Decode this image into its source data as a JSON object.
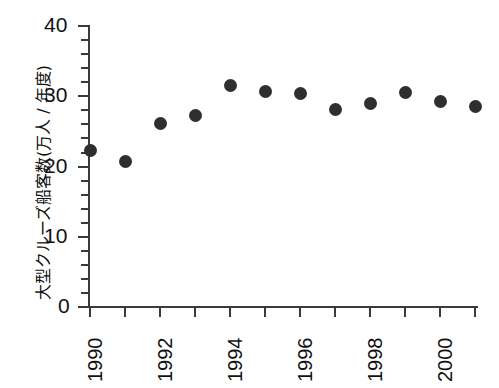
{
  "chart_data": {
    "type": "scatter",
    "title": "",
    "xlabel": "",
    "ylabel": "大型クルーズ船客数(万人 / 年度)",
    "x": [
      1990,
      1991,
      1992,
      1993,
      1994,
      1995,
      1996,
      1997,
      1998,
      1999,
      2000,
      2001
    ],
    "values": [
      22.2,
      20.6,
      26.0,
      27.2,
      31.4,
      30.6,
      30.3,
      28.0,
      28.8,
      30.4,
      29.2,
      28.4
    ],
    "xlim": [
      1989.5,
      2001.5
    ],
    "ylim": [
      0,
      40
    ],
    "y_ticks": [
      0,
      10,
      20,
      30,
      40
    ],
    "y_tick_labels": [
      "0",
      "10",
      "20",
      "30",
      "40"
    ],
    "y_minor_step": 2,
    "x_ticks": [
      1990,
      1991,
      1992,
      1993,
      1994,
      1995,
      1996,
      1997,
      1998,
      1999,
      2000,
      2001
    ],
    "x_tick_labels": [
      "1990",
      "",
      "1992",
      "",
      "1994",
      "",
      "1996",
      "",
      "1998",
      "",
      "2000",
      ""
    ],
    "grid": false,
    "legend": null,
    "marker_color": "#2f2f2f",
    "axis_color": "#3a3a3a"
  },
  "axis": {
    "y_label": "大型クルーズ船客数(万人 / 年度)",
    "y_tick_0": "0",
    "y_tick_10": "10",
    "y_tick_20": "20",
    "y_tick_30": "30",
    "y_tick_40": "40",
    "x_tick_1990": "1990",
    "x_tick_1992": "1992",
    "x_tick_1994": "1994",
    "x_tick_1996": "1996",
    "x_tick_1998": "1998",
    "x_tick_2000": "2000"
  }
}
